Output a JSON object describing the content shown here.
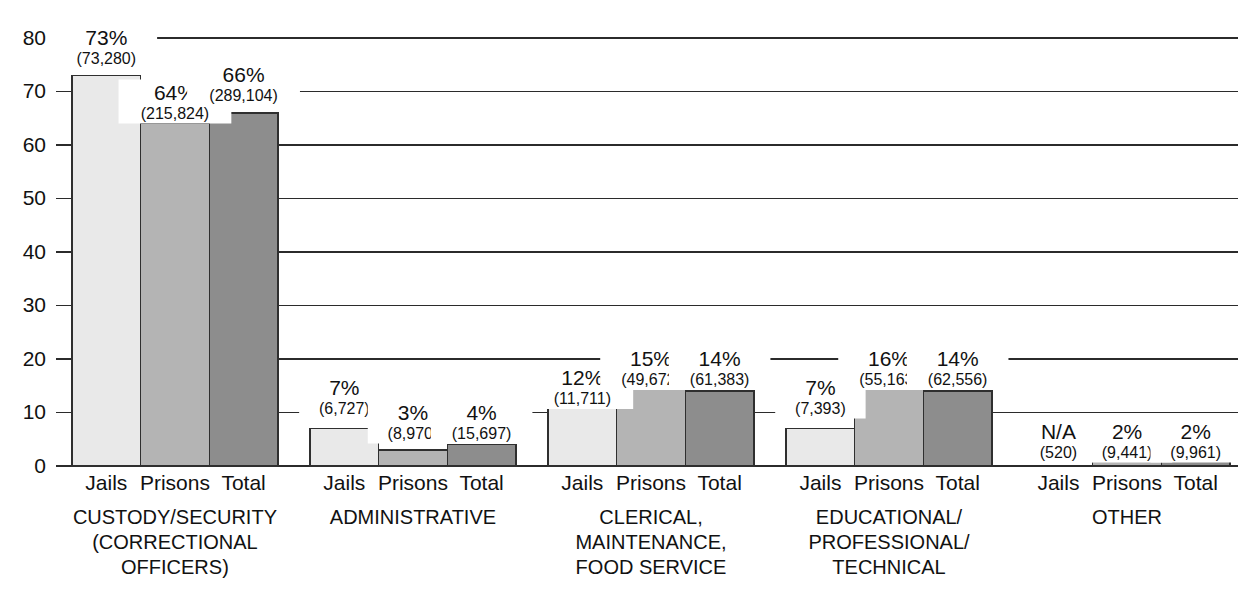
{
  "chart_data": {
    "type": "bar",
    "title": "",
    "subtitle": "",
    "xlabel": "",
    "ylabel": "",
    "ylim": [
      0,
      80
    ],
    "ytick_labels": [
      "0",
      "10",
      "20",
      "30",
      "40",
      "50",
      "60",
      "70",
      "80"
    ],
    "ytick_values": [
      0,
      10,
      20,
      30,
      40,
      50,
      60,
      70,
      80
    ],
    "grid": true,
    "legend_position": "none",
    "series_names": [
      "Jails",
      "Prisons",
      "Total"
    ],
    "series_colors": [
      "#e9e9e9",
      "#b4b4b4",
      "#8d8d8d"
    ],
    "categories": [
      "CUSTODY/SECURITY (CORRECTIONAL OFFICERS)",
      "ADMINISTRATIVE",
      "CLERICAL, MAINTENANCE, FOOD SERVICE",
      "EDUCATIONAL/ PROFESSIONAL/ TECHNICAL",
      "OTHER"
    ],
    "category_label_lines": [
      [
        "CUSTODY/SECURITY",
        "(CORRECTIONAL",
        "OFFICERS)"
      ],
      [
        "ADMINISTRATIVE"
      ],
      [
        "CLERICAL,",
        "MAINTENANCE,",
        "FOOD SERVICE"
      ],
      [
        "EDUCATIONAL/",
        "PROFESSIONAL/",
        "TECHNICAL"
      ],
      [
        "OTHER"
      ]
    ],
    "series": [
      {
        "name": "Jails",
        "values": [
          73,
          7,
          12,
          7,
          null
        ],
        "value_labels": [
          "73%",
          "7%",
          "12%",
          "7%",
          "N/A"
        ],
        "counts": [
          "(73,280)",
          "(6,727)",
          "(11,711)",
          "(7,393)",
          "(520)"
        ]
      },
      {
        "name": "Prisons",
        "values": [
          64,
          3,
          15,
          16,
          2
        ],
        "value_labels": [
          "64%",
          "3%",
          "15%",
          "16%",
          "2%"
        ],
        "counts": [
          "(215,824)",
          "(8,970)",
          "(49,672)",
          "(55,163)",
          "(9,441)"
        ]
      },
      {
        "name": "Total",
        "values": [
          66,
          4,
          14,
          14,
          2
        ],
        "value_labels": [
          "66%",
          "4%",
          "14%",
          "14%",
          "2%"
        ],
        "counts": [
          "(289,104)",
          "(15,697)",
          "(61,383)",
          "(62,556)",
          "(9,961)"
        ]
      }
    ],
    "groups": [
      {
        "category_lines": [
          "CUSTODY/SECURITY",
          "(CORRECTIONAL",
          "OFFICERS)"
        ],
        "bars": [
          {
            "series": "Jails",
            "value": 73,
            "pct": "73%",
            "count": "(73,280)",
            "color": "#e9e9e9",
            "label_level": 80
          },
          {
            "series": "Prisons",
            "value": 64,
            "pct": "64%",
            "count": "(215,824)",
            "color": "#b4b4b4",
            "label_level": 70
          },
          {
            "series": "Total",
            "value": 66,
            "pct": "66%",
            "count": "(289,104)",
            "color": "#8d8d8d",
            "label_level": 70
          }
        ]
      },
      {
        "category_lines": [
          "ADMINISTRATIVE"
        ],
        "bars": [
          {
            "series": "Jails",
            "value": 7,
            "pct": "7%",
            "count": "(6,727)",
            "color": "#e9e9e9",
            "label_level": 10
          },
          {
            "series": "Prisons",
            "value": 3,
            "pct": "3%",
            "count": "(8,970)",
            "color": "#b4b4b4",
            "label_level": 10
          },
          {
            "series": "Total",
            "value": 4,
            "pct": "4%",
            "count": "(15,697)",
            "color": "#8d8d8d",
            "label_level": 10
          }
        ]
      },
      {
        "category_lines": [
          "CLERICAL,",
          "MAINTENANCE,",
          "FOOD SERVICE"
        ],
        "bars": [
          {
            "series": "Jails",
            "value": 12,
            "pct": "12%",
            "count": "(11,711)",
            "color": "#e9e9e9",
            "label_level": 20
          },
          {
            "series": "Prisons",
            "value": 15,
            "pct": "15%",
            "count": "(49,672)",
            "color": "#b4b4b4",
            "label_level": 20
          },
          {
            "series": "Total",
            "value": 14,
            "pct": "14%",
            "count": "(61,383)",
            "color": "#8d8d8d",
            "label_level": 20
          }
        ]
      },
      {
        "category_lines": [
          "EDUCATIONAL/",
          "PROFESSIONAL/",
          "TECHNICAL"
        ],
        "bars": [
          {
            "series": "Jails",
            "value": 7,
            "pct": "7%",
            "count": "(7,393)",
            "color": "#e9e9e9",
            "label_level": 10
          },
          {
            "series": "Prisons",
            "value": 16,
            "pct": "16%",
            "count": "(55,163)",
            "color": "#b4b4b4",
            "label_level": 20
          },
          {
            "series": "Total",
            "value": 14,
            "pct": "14%",
            "count": "(62,556)",
            "color": "#8d8d8d",
            "label_level": 20
          }
        ]
      },
      {
        "category_lines": [
          "OTHER"
        ],
        "bars": [
          {
            "series": "Jails",
            "value": null,
            "pct": "N/A",
            "count": "(520)",
            "color": "#e9e9e9",
            "label_level": 10
          },
          {
            "series": "Prisons",
            "value": 2,
            "pct": "2%",
            "count": "(9,441)",
            "color": "#b4b4b4",
            "label_level": 10
          },
          {
            "series": "Total",
            "value": 2,
            "pct": "2%",
            "count": "(9,961)",
            "color": "#8d8d8d",
            "label_level": 10
          }
        ]
      }
    ]
  }
}
